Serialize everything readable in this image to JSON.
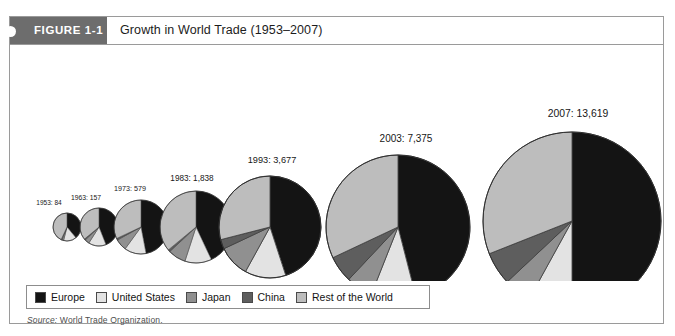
{
  "figure": {
    "tab_label": "FIGURE 1-1",
    "title": "Growth in World Trade (1953–2007)",
    "source_label": "Source:",
    "source_text": "World Trade Organization."
  },
  "legend": {
    "items": [
      {
        "label": "Europe",
        "color": "#141414"
      },
      {
        "label": "United States",
        "color": "#e3e3e3"
      },
      {
        "label": "Japan",
        "color": "#909090"
      },
      {
        "label": "China",
        "color": "#5e5e5e"
      },
      {
        "label": "Rest of the World",
        "color": "#bdbdbd"
      }
    ]
  },
  "chart_data": {
    "type": "pie",
    "title": "Growth in World Trade (1953–2007)",
    "xlabel": "",
    "ylabel": "",
    "value_unit": "billions of US dollars",
    "note": "Six proportional pie charts; pie area scales with total world trade value.",
    "series_names": [
      "Europe",
      "United States",
      "Japan",
      "China",
      "Rest of the World"
    ],
    "series_colors": [
      "#141414",
      "#e3e3e3",
      "#909090",
      "#5e5e5e",
      "#bdbdbd"
    ],
    "pies": [
      {
        "year": "1953",
        "total": 84,
        "label": "1953: 84",
        "radius_px": 14,
        "cx": 57,
        "cy": 182,
        "label_x": 39,
        "label_y": 160,
        "label_size": 6.5,
        "slices": [
          {
            "name": "Europe",
            "percent": 39
          },
          {
            "name": "United States",
            "percent": 15
          },
          {
            "name": "Japan",
            "percent": 2
          },
          {
            "name": "China",
            "percent": 1
          },
          {
            "name": "Rest of the World",
            "percent": 43
          }
        ]
      },
      {
        "year": "1963",
        "total": 157,
        "label": "1963: 157",
        "radius_px": 19,
        "cx": 89,
        "cy": 182,
        "label_x": 76,
        "label_y": 155,
        "label_size": 6.8,
        "slices": [
          {
            "name": "Europe",
            "percent": 44
          },
          {
            "name": "United States",
            "percent": 15
          },
          {
            "name": "Japan",
            "percent": 4
          },
          {
            "name": "China",
            "percent": 1
          },
          {
            "name": "Rest of the World",
            "percent": 36
          }
        ]
      },
      {
        "year": "1973",
        "total": 579,
        "label": "1973: 579",
        "radius_px": 27,
        "cx": 131,
        "cy": 182,
        "label_x": 120,
        "label_y": 146,
        "label_size": 7.2,
        "slices": [
          {
            "name": "Europe",
            "percent": 47
          },
          {
            "name": "United States",
            "percent": 13
          },
          {
            "name": "Japan",
            "percent": 7
          },
          {
            "name": "China",
            "percent": 1
          },
          {
            "name": "Rest of the World",
            "percent": 32
          }
        ]
      },
      {
        "year": "1983",
        "total": 1838,
        "label": "1983: 1,838",
        "radius_px": 36,
        "cx": 186,
        "cy": 182,
        "label_x": 182,
        "label_y": 136,
        "label_size": 8.2,
        "slices": [
          {
            "name": "Europe",
            "percent": 43
          },
          {
            "name": "United States",
            "percent": 12
          },
          {
            "name": "Japan",
            "percent": 8
          },
          {
            "name": "China",
            "percent": 1
          },
          {
            "name": "Rest of the World",
            "percent": 36
          }
        ]
      },
      {
        "year": "1993",
        "total": 3677,
        "label": "1993: 3,677",
        "radius_px": 51,
        "cx": 260,
        "cy": 182,
        "label_x": 262,
        "label_y": 118,
        "label_size": 9.2,
        "slices": [
          {
            "name": "Europe",
            "percent": 45
          },
          {
            "name": "United States",
            "percent": 13
          },
          {
            "name": "Japan",
            "percent": 10
          },
          {
            "name": "China",
            "percent": 3
          },
          {
            "name": "Rest of the World",
            "percent": 29
          }
        ]
      },
      {
        "year": "2003",
        "total": 7375,
        "label": "2003: 7,375",
        "radius_px": 72,
        "cx": 388,
        "cy": 182,
        "label_x": 396,
        "label_y": 97,
        "label_size": 10,
        "slices": [
          {
            "name": "Europe",
            "percent": 46
          },
          {
            "name": "United States",
            "percent": 10
          },
          {
            "name": "Japan",
            "percent": 6
          },
          {
            "name": "China",
            "percent": 6
          },
          {
            "name": "Rest of the World",
            "percent": 32
          }
        ]
      },
      {
        "year": "2007",
        "total": 13619,
        "label": "2007: 13,619",
        "radius_px": 89,
        "cx": 562,
        "cy": 176,
        "label_x": 568,
        "label_y": 72,
        "label_size": 10.4,
        "slices": [
          {
            "name": "Europe",
            "percent": 50
          },
          {
            "name": "United States",
            "percent": 8
          },
          {
            "name": "Japan",
            "percent": 5
          },
          {
            "name": "China",
            "percent": 6
          },
          {
            "name": "Rest of the World",
            "percent": 31
          }
        ]
      }
    ]
  }
}
